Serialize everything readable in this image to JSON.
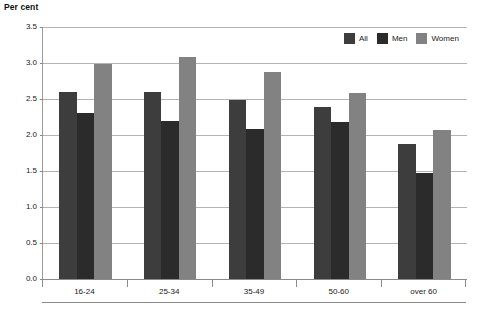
{
  "chart_data": {
    "type": "bar",
    "title": "",
    "subtitle": "",
    "xlabel": "",
    "ylabel": "Per cent",
    "ylim": [
      0.0,
      3.5
    ],
    "ytick_step": 0.5,
    "yticks": [
      "0.0",
      "0.5",
      "1.0",
      "1.5",
      "2.0",
      "2.5",
      "3.0",
      "3.5"
    ],
    "ytick_values": [
      0.0,
      0.5,
      1.0,
      1.5,
      2.0,
      2.5,
      3.0,
      3.5
    ],
    "grid": true,
    "grid_axis": "y",
    "legend_position": "top-right-inside",
    "categories": [
      "16-24",
      "25-34",
      "35-49",
      "50-60",
      "over 60"
    ],
    "series": [
      {
        "name": "All",
        "color": "#3d3d3d",
        "values": [
          2.6,
          2.6,
          2.49,
          2.39,
          1.87
        ]
      },
      {
        "name": "Men",
        "color": "#2b2b2b",
        "values": [
          2.3,
          2.19,
          2.08,
          2.18,
          1.47
        ]
      },
      {
        "name": "Women",
        "color": "#828282",
        "values": [
          2.99,
          3.09,
          2.88,
          2.58,
          2.07
        ]
      }
    ]
  },
  "axis": {
    "y_title": "Per cent"
  },
  "footer": {
    "caption": ""
  }
}
